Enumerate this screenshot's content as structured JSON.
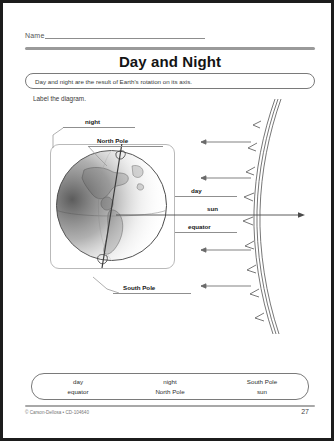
{
  "header": {
    "name_label": "Name",
    "title": "Day and Night",
    "statement": "Day and night are the result of Earth's rotation on its axis.",
    "directions": "Label the diagram."
  },
  "diagram": {
    "labels": [
      {
        "id": "night",
        "text": "night"
      },
      {
        "id": "north-pole",
        "text": "North Pole"
      },
      {
        "id": "day",
        "text": "day"
      },
      {
        "id": "sun",
        "text": "sun"
      },
      {
        "id": "equator",
        "text": "equator"
      },
      {
        "id": "south-pole",
        "text": "South Pole"
      }
    ],
    "earth_icon": "earth-globe-icon",
    "sun_icon": "sun-edge-icon",
    "ray_icon": "sunlight-ray-arrow-icon"
  },
  "word_bank": {
    "columns": [
      {
        "line1": "day",
        "line2": "equator"
      },
      {
        "line1": "night",
        "line2": "North Pole"
      },
      {
        "line1": "South Pole",
        "line2": "sun"
      }
    ]
  },
  "footer": {
    "copyright": "© Carson-Dellosa • CD-104640",
    "page_number": "27"
  }
}
